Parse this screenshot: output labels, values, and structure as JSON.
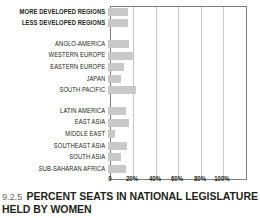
{
  "caption": {
    "number": "9.2.5",
    "text": "PERCENT SEATS IN NATIONAL LEGISLATURE HELD BY WOMEN"
  },
  "axis": {
    "ticks": [
      "0",
      "20%",
      "40%",
      "60%",
      "80%",
      "100%"
    ]
  },
  "chart_data": {
    "type": "bar",
    "orientation": "horizontal",
    "title": "PERCENT SEATS IN NATIONAL LEGISLATURE HELD BY WOMEN",
    "figure_number": "9.2.5",
    "xlabel": "",
    "ylabel": "",
    "xlim": [
      0,
      100
    ],
    "xtick_values": [
      0,
      20,
      40,
      60,
      80,
      100
    ],
    "xtick_labels": [
      "0",
      "20%",
      "40%",
      "60%",
      "80%",
      "100%"
    ],
    "grid": true,
    "legend": "none",
    "bar_color": "#c9c9c9",
    "categories": [
      "MORE DEVELOPED REGIONS",
      "LESS DEVELOPED REGIONS",
      "ANGLO-AMERICA",
      "WESTERN EUROPE",
      "EASTERN EUROPE",
      "JAPAN",
      "SOUTH PACIFIC",
      "LATIN AMERICA",
      "EAST ASIA",
      "MIDDLE EAST",
      "SOUTHEAST ASIA",
      "SOUTH ASIA",
      "SUB-SAHARAN AFRICA"
    ],
    "values": [
      18,
      18,
      19,
      23,
      14,
      12,
      25,
      16,
      19,
      6,
      17,
      12,
      16
    ],
    "groups": [
      {
        "name": "summary",
        "bold": true,
        "categories": [
          "MORE DEVELOPED REGIONS",
          "LESS DEVELOPED REGIONS"
        ]
      },
      {
        "name": "regions",
        "bold": false,
        "categories": [
          "ANGLO-AMERICA",
          "WESTERN EUROPE",
          "EASTERN EUROPE",
          "JAPAN",
          "SOUTH PACIFIC",
          "LATIN AMERICA",
          "EAST ASIA",
          "MIDDLE EAST",
          "SOUTHEAST ASIA",
          "SOUTH ASIA",
          "SUB-SAHARAN AFRICA"
        ]
      }
    ]
  },
  "rows": [
    {
      "label": "MORE DEVELOPED REGIONS",
      "value": 18,
      "bold": true,
      "spacer_after": false
    },
    {
      "label": "LESS DEVELOPED REGIONS",
      "value": 18,
      "bold": true,
      "spacer_after": true
    },
    {
      "label": "ANGLO-AMERICA",
      "value": 19,
      "bold": false,
      "spacer_after": false
    },
    {
      "label": "WESTERN EUROPE",
      "value": 23,
      "bold": false,
      "spacer_after": false
    },
    {
      "label": "EASTERN EUROPE",
      "value": 14,
      "bold": false,
      "spacer_after": false
    },
    {
      "label": "JAPAN",
      "value": 12,
      "bold": false,
      "spacer_after": false
    },
    {
      "label": "SOUTH PACIFIC",
      "value": 25,
      "bold": false,
      "spacer_after": true
    },
    {
      "label": "LATIN AMERICA",
      "value": 16,
      "bold": false,
      "spacer_after": false
    },
    {
      "label": "EAST ASIA",
      "value": 19,
      "bold": false,
      "spacer_after": false
    },
    {
      "label": "MIDDLE EAST",
      "value": 6,
      "bold": false,
      "spacer_after": false
    },
    {
      "label": "SOUTHEAST ASIA",
      "value": 17,
      "bold": false,
      "spacer_after": false
    },
    {
      "label": "SOUTH ASIA",
      "value": 12,
      "bold": false,
      "spacer_after": false
    },
    {
      "label": "SUB-SAHARAN AFRICA",
      "value": 16,
      "bold": false,
      "spacer_after": false
    }
  ]
}
